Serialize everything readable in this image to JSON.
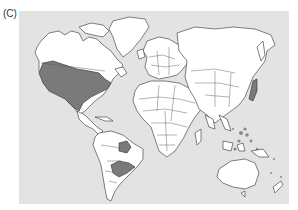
{
  "figure": {
    "panel_label": "(C)",
    "map": {
      "type": "world-political-outline",
      "colors": {
        "ocean": "#e3e3e3",
        "land": "#ffffff",
        "highlighted": "#7a7a7a",
        "border": "#4a4a4a"
      },
      "highlighted_regions": [
        "United States (contiguous)",
        "Central Brazil",
        "Paraguay / Northern Argentina / Southern Brazil",
        "Japan",
        "Philippines",
        "Indonesia",
        "Pacific islands"
      ]
    }
  }
}
